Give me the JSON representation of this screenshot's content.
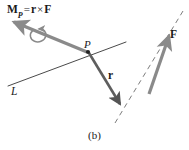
{
  "figure": {
    "caption": "(b)",
    "background_color": "#ffffff",
    "vector_color": "#8a8a8a",
    "line_color": "#3c3c3c",
    "text_color": "#1a1a1a",
    "labels": {
      "moment": {
        "symbol": "M",
        "subscript": "P",
        "equals": "=",
        "r": "r",
        "cross": "×",
        "force": "F",
        "full_text": "M_P = r × F"
      },
      "point": "P",
      "line": "L",
      "position_vector": "r",
      "force_vector": "F"
    },
    "geometry": {
      "point_P": [
        88,
        52
      ],
      "moment_arrow": {
        "from": [
          88,
          52
        ],
        "to": [
          9,
          19
        ]
      },
      "line_L": {
        "from": [
          8,
          86
        ],
        "to": [
          126,
          42
        ]
      },
      "position_vector_r": {
        "from": [
          88,
          52
        ],
        "to": [
          122,
          108
        ]
      },
      "force_vector_F": {
        "from": [
          150,
          92
        ],
        "to": [
          172,
          30
        ]
      },
      "force_action_line_dashed": {
        "from": [
          115,
          122
        ],
        "to": [
          182,
          12
        ]
      },
      "spin_center": [
        40,
        33
      ]
    }
  }
}
